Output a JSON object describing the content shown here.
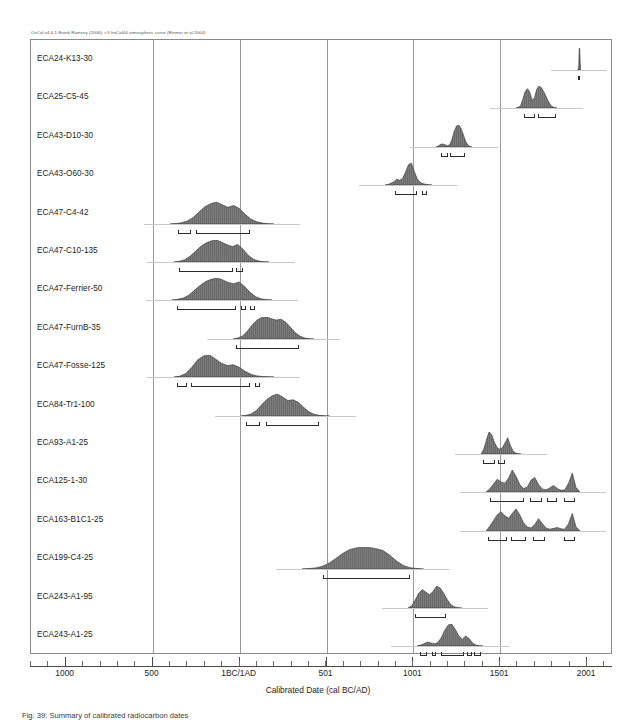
{
  "header_note": "OxCal v4.0.1 Bronk Ramsey (2006); r:5 IntCal04 atmospheric curve (Reimer et al 2004)",
  "axis_title": "Calibrated Date (cal BC/AD)",
  "figure_caption": "Fig. 39: Summary of calibrated radiocarbon dates",
  "chart_data": {
    "type": "area",
    "xlabel": "Calibrated Date (cal BC/AD)",
    "ylabel": "",
    "xlim": [
      -1200,
      2150
    ],
    "grid": true,
    "legend": "none",
    "x_tick_labels": [
      "1000",
      "500",
      "1BC/1AD",
      "501",
      "1001",
      "1501",
      "2001"
    ],
    "x_tick_values": [
      -1000,
      -500,
      1,
      501,
      1001,
      1501,
      2001
    ],
    "gridline_values": [
      -500,
      1,
      501,
      1001,
      1501
    ],
    "minor_tick_step": 100,
    "series": [
      {
        "name": "ECA24-K13-30",
        "peak_x": 1955,
        "x_start": 1940,
        "x_end": 1968,
        "profile": [
          0,
          0,
          0,
          2,
          22,
          96,
          100,
          40,
          6,
          1,
          0,
          0
        ],
        "ranges": [
          [
            1950,
            1957
          ]
        ]
      },
      {
        "name": "ECA25-C5-45",
        "peak_x": 1680,
        "x_start": 1590,
        "x_end": 1830,
        "profile": [
          0,
          3,
          10,
          42,
          76,
          88,
          70,
          34,
          48,
          86,
          100,
          92,
          74,
          52,
          30,
          12,
          4,
          1,
          0
        ],
        "ranges": [
          [
            1637,
            1700
          ],
          [
            1718,
            1820
          ]
        ]
      },
      {
        "name": "ECA43-D10-30",
        "peak_x": 1260,
        "x_start": 1130,
        "x_end": 1340,
        "profile": [
          0,
          4,
          12,
          14,
          10,
          6,
          10,
          34,
          72,
          96,
          100,
          84,
          56,
          26,
          8,
          2,
          0
        ],
        "ranges": [
          [
            1158,
            1200
          ],
          [
            1212,
            1300
          ]
        ]
      },
      {
        "name": "ECA43-O60-30",
        "peak_x": 985,
        "x_start": 840,
        "x_end": 1110,
        "profile": [
          0,
          2,
          8,
          14,
          26,
          22,
          30,
          58,
          92,
          100,
          62,
          28,
          12,
          6,
          3,
          1,
          0
        ],
        "ranges": [
          [
            896,
            1024
          ],
          [
            1050,
            1082
          ]
        ]
      },
      {
        "name": "ECA47-C4-42",
        "peak_x": -105,
        "x_start": -400,
        "x_end": 200,
        "profile": [
          0,
          2,
          6,
          14,
          30,
          54,
          78,
          92,
          100,
          88,
          76,
          84,
          70,
          44,
          22,
          10,
          4,
          1,
          0
        ],
        "ranges": [
          [
            -355,
            -280
          ],
          [
            -250,
            60
          ]
        ]
      },
      {
        "name": "ECA47-C10-135",
        "peak_x": -65,
        "x_start": -380,
        "x_end": 170,
        "profile": [
          0,
          3,
          10,
          26,
          48,
          70,
          86,
          96,
          100,
          90,
          78,
          70,
          80,
          58,
          30,
          12,
          4,
          1,
          0
        ],
        "ranges": [
          [
            -350,
            -40
          ],
          [
            -20,
            20
          ]
        ]
      },
      {
        "name": "ECA47-Ferrier-50",
        "peak_x": -60,
        "x_start": -390,
        "x_end": 190,
        "profile": [
          0,
          3,
          9,
          22,
          44,
          66,
          84,
          94,
          100,
          92,
          80,
          74,
          82,
          60,
          34,
          14,
          5,
          1,
          0
        ],
        "ranges": [
          [
            -360,
            -20
          ],
          [
            10,
            40
          ],
          [
            60,
            90
          ]
        ]
      },
      {
        "name": "ECA47-FurnB-35",
        "peak_x": 190,
        "x_start": -40,
        "x_end": 430,
        "profile": [
          0,
          4,
          14,
          36,
          64,
          86,
          98,
          100,
          92,
          86,
          90,
          76,
          52,
          28,
          12,
          4,
          1,
          0
        ],
        "ranges": [
          [
            -20,
            340
          ]
        ]
      },
      {
        "name": "ECA47-Fosse-125",
        "peak_x": -140,
        "x_start": -380,
        "x_end": 200,
        "profile": [
          0,
          4,
          16,
          44,
          78,
          96,
          100,
          82,
          62,
          52,
          56,
          44,
          26,
          12,
          5,
          2,
          1,
          0
        ],
        "ranges": [
          [
            -360,
            -300
          ],
          [
            -280,
            60
          ],
          [
            90,
            120
          ]
        ]
      },
      {
        "name": "ECA84-Tr1-100",
        "peak_x": 300,
        "x_start": 10,
        "x_end": 520,
        "profile": [
          0,
          3,
          10,
          26,
          52,
          76,
          92,
          100,
          86,
          70,
          74,
          62,
          40,
          20,
          8,
          3,
          1,
          0
        ],
        "ranges": [
          [
            40,
            120
          ],
          [
            150,
            460
          ]
        ]
      },
      {
        "name": "ECA93-A1-25",
        "peak_x": 1440,
        "x_start": 1390,
        "x_end": 1620,
        "profile": [
          0,
          20,
          62,
          100,
          88,
          54,
          30,
          22,
          28,
          50,
          74,
          40,
          14,
          4,
          1,
          0
        ],
        "ranges": [
          [
            1400,
            1470
          ],
          [
            1490,
            1530
          ]
        ]
      },
      {
        "name": "ECA125-1-30",
        "peak_x": 1530,
        "x_start": 1420,
        "x_end": 1960,
        "profile": [
          0,
          14,
          36,
          58,
          46,
          40,
          62,
          100,
          72,
          34,
          16,
          22,
          54,
          66,
          34,
          14,
          10,
          18,
          30,
          16,
          8,
          10,
          40,
          86,
          20,
          2
        ],
        "ranges": [
          [
            1440,
            1640
          ],
          [
            1670,
            1740
          ],
          [
            1770,
            1830
          ],
          [
            1870,
            1930
          ]
        ]
      },
      {
        "name": "ECA163-B1C1-25",
        "peak_x": 1490,
        "x_start": 1420,
        "x_end": 1960,
        "profile": [
          0,
          22,
          48,
          74,
          88,
          70,
          58,
          80,
          100,
          74,
          38,
          18,
          14,
          30,
          56,
          34,
          14,
          8,
          12,
          16,
          10,
          8,
          34,
          80,
          18,
          2
        ],
        "ranges": [
          [
            1430,
            1540
          ],
          [
            1560,
            1650
          ],
          [
            1690,
            1760
          ],
          [
            1870,
            1930
          ]
        ]
      },
      {
        "name": "ECA199-C4-25",
        "peak_x": 760,
        "x_start": 360,
        "x_end": 1060,
        "profile": [
          0,
          2,
          5,
          12,
          26,
          48,
          70,
          88,
          96,
          100,
          98,
          92,
          84,
          62,
          36,
          16,
          6,
          2,
          0
        ],
        "ranges": [
          [
            480,
            980
          ]
        ]
      },
      {
        "name": "ECA243-A1-95",
        "peak_x": 1120,
        "x_start": 970,
        "x_end": 1280,
        "profile": [
          0,
          10,
          36,
          68,
          84,
          72,
          60,
          76,
          100,
          90,
          66,
          36,
          14,
          5,
          1,
          0
        ],
        "ranges": [
          [
            1010,
            1190
          ]
        ]
      },
      {
        "name": "ECA243-A1-25",
        "peak_x": 1230,
        "x_start": 1020,
        "x_end": 1400,
        "profile": [
          0,
          4,
          10,
          18,
          14,
          10,
          16,
          38,
          72,
          96,
          100,
          76,
          48,
          30,
          46,
          34,
          14,
          4,
          1,
          0
        ],
        "ranges": [
          [
            1040,
            1080
          ],
          [
            1110,
            1130
          ],
          [
            1160,
            1290
          ],
          [
            1310,
            1340
          ],
          [
            1350,
            1390
          ]
        ]
      }
    ]
  }
}
